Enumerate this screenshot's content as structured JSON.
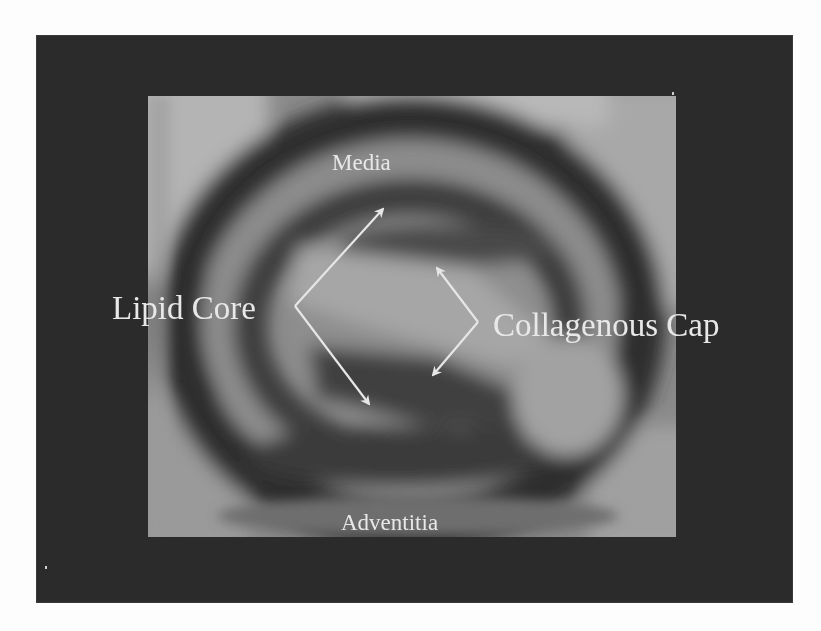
{
  "figure": {
    "colors": {
      "frame_background": "#2b2b2b",
      "page_background": "#fdfdfd",
      "label_color": "#e8e8e8",
      "arrow_color": "#e6e6e6"
    },
    "labels": {
      "media": "Media",
      "lipid_core": "Lipid Core",
      "collagenous_cap": "Collagenous Cap",
      "adventitia": "Adventitia"
    },
    "arrows": [
      {
        "name": "lipid-core-arrow",
        "vertex": [
          295,
          306
        ],
        "tips": [
          [
            383,
            208
          ],
          [
            370,
            405
          ]
        ]
      },
      {
        "name": "collagenous-cap-arrow",
        "vertex": [
          478,
          322
        ],
        "tips": [
          [
            437,
            267
          ],
          [
            432,
            376
          ]
        ]
      }
    ]
  }
}
